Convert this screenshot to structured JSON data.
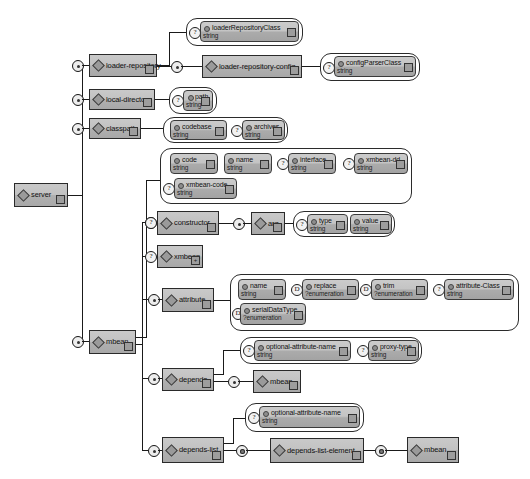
{
  "diagram": {
    "title": "server",
    "type": "xml-schema-tree",
    "root": {
      "name": "server",
      "kind": "element",
      "handle_icon": "expand-collapse-icon"
    },
    "elements": [
      {
        "id": "server",
        "name": "server",
        "kind": "element",
        "occurrence": "required"
      },
      {
        "id": "loader-repository",
        "name": "loader-repository",
        "kind": "element",
        "occurrence": "sequence"
      },
      {
        "id": "loader-repository-config",
        "name": "loader-repository-config",
        "kind": "element",
        "occurrence": "sequence"
      },
      {
        "id": "local-directory",
        "name": "local-directory",
        "kind": "element",
        "occurrence": "sequence"
      },
      {
        "id": "classpath",
        "name": "classpath",
        "kind": "element",
        "occurrence": "sequence"
      },
      {
        "id": "mbean",
        "name": "mbean",
        "kind": "element",
        "occurrence": "sequence"
      },
      {
        "id": "constructor",
        "name": "constructor",
        "kind": "element",
        "occurrence": "optional"
      },
      {
        "id": "arg",
        "name": "arg",
        "kind": "element",
        "occurrence": "sequence"
      },
      {
        "id": "xmbean",
        "name": "xmbean",
        "kind": "element",
        "occurrence": "optional"
      },
      {
        "id": "attribute",
        "name": "attribute",
        "kind": "element",
        "occurrence": "sequence"
      },
      {
        "id": "depends",
        "name": "depends",
        "kind": "element",
        "occurrence": "sequence"
      },
      {
        "id": "depends-mbean",
        "name": "mbean",
        "kind": "element",
        "occurrence": "sequence"
      },
      {
        "id": "depends-list",
        "name": "depends-list",
        "kind": "element",
        "occurrence": "sequence"
      },
      {
        "id": "depends-list-element",
        "name": "depends-list-element",
        "kind": "element",
        "occurrence": "repeating"
      },
      {
        "id": "depends-list-mbean",
        "name": "mbean",
        "kind": "element",
        "occurrence": "repeating"
      }
    ],
    "attributes": [
      {
        "id": "loaderRepositoryClass",
        "name": "loaderRepositoryClass",
        "type": "string",
        "marker": "?"
      },
      {
        "id": "configParserClass",
        "name": "configParserClass",
        "type": "string",
        "marker": "?"
      },
      {
        "id": "path",
        "name": "path",
        "type": "string",
        "marker": "?"
      },
      {
        "id": "codebase",
        "name": "codebase",
        "type": "string",
        "marker": ""
      },
      {
        "id": "archives",
        "name": "archives",
        "type": "string",
        "marker": "?"
      },
      {
        "id": "code",
        "name": "code",
        "type": "string",
        "marker": ""
      },
      {
        "id": "name",
        "name": "name",
        "type": "string",
        "marker": ""
      },
      {
        "id": "interface",
        "name": "interface",
        "type": "string",
        "marker": "?"
      },
      {
        "id": "xmbean-dd",
        "name": "xmbean-dd",
        "type": "string",
        "marker": "?"
      },
      {
        "id": "xmbean-code",
        "name": "xmbean-code",
        "type": "string",
        "marker": "?"
      },
      {
        "id": "type",
        "name": "type",
        "type": "string",
        "marker": "?"
      },
      {
        "id": "value",
        "name": "value",
        "type": "string",
        "marker": ""
      },
      {
        "id": "attr-name",
        "name": "name",
        "type": "string",
        "marker": ""
      },
      {
        "id": "replace",
        "name": "replace",
        "type": "?enumeration",
        "marker": "D"
      },
      {
        "id": "trim",
        "name": "trim",
        "type": "?enumeration",
        "marker": "D"
      },
      {
        "id": "attribute-Class",
        "name": "attribute-Class",
        "type": "string",
        "marker": "?"
      },
      {
        "id": "serialDataType",
        "name": "serialDataType",
        "type": "?enumeration",
        "marker": "D"
      },
      {
        "id": "dep-optional-attribute-name",
        "name": "optional-attribute-name",
        "type": "string",
        "marker": "?"
      },
      {
        "id": "proxy-type",
        "name": "proxy-type",
        "type": "string",
        "marker": "?"
      },
      {
        "id": "list-optional-attribute-name",
        "name": "optional-attribute-name",
        "type": "string",
        "marker": "?"
      }
    ],
    "legend": {
      "optional_marker": "?",
      "default_marker": "D",
      "expand_icon": "+"
    },
    "colors": {
      "box_fill": "#c2c2c2",
      "box_fill_dark": "#a8a8a8",
      "border": "#2a2a2a",
      "background": "#ffffff"
    }
  }
}
